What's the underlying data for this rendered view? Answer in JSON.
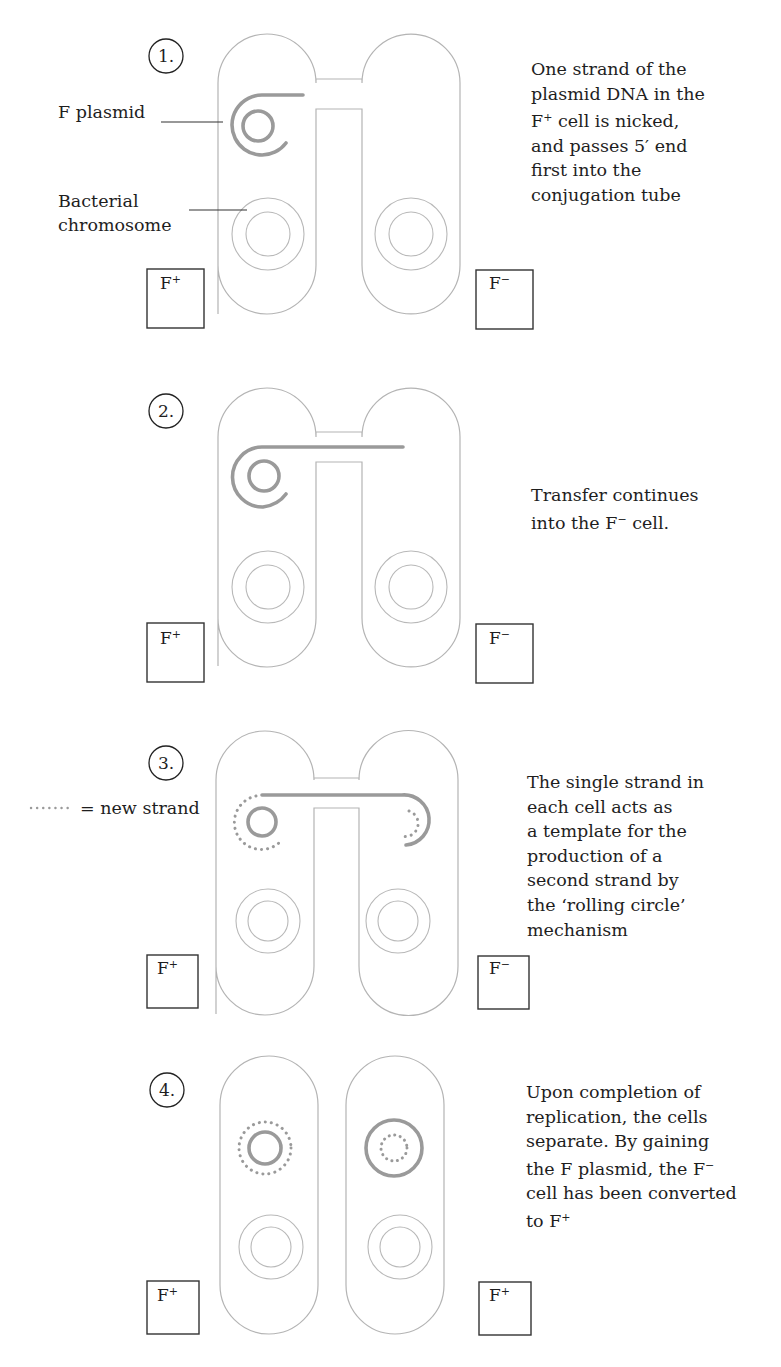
{
  "figure": {
    "colors": {
      "cell_outline": "#b4b4b4",
      "plasmid_strand": "#9a9a9a",
      "text": "#1e1e1e",
      "box_border": "#333333"
    }
  },
  "labels": {
    "f_plasmid": "F plasmid",
    "bacterial_chromosome_line1": "Bacterial",
    "bacterial_chromosome_line2": "chromosome",
    "legend_dots": "·······",
    "legend_text": "= new strand"
  },
  "steps": [
    {
      "number": "1.",
      "left_cell": {
        "base": "F",
        "sup": "+"
      },
      "right_cell": {
        "base": "F",
        "sup": "−"
      },
      "description": [
        "One strand of the",
        "plasmid DNA in the",
        {
          "base": "F",
          "sup": "+",
          "rest": " cell is nicked,"
        },
        "and passes 5′ end",
        "first into the",
        "conjugation tube"
      ]
    },
    {
      "number": "2.",
      "left_cell": {
        "base": "F",
        "sup": "+"
      },
      "right_cell": {
        "base": "F",
        "sup": "−"
      },
      "description": [
        "Transfer continues",
        {
          "pre": "into the ",
          "base": "F",
          "sup": "−",
          "rest": " cell."
        }
      ]
    },
    {
      "number": "3.",
      "left_cell": {
        "base": "F",
        "sup": "+"
      },
      "right_cell": {
        "base": "F",
        "sup": "−"
      },
      "description": [
        "The single strand in",
        "each cell acts as",
        "a template for the",
        "production of a",
        "second strand by",
        "the ‘rolling circle’",
        "mechanism"
      ]
    },
    {
      "number": "4.",
      "left_cell": {
        "base": "F",
        "sup": "+"
      },
      "right_cell": {
        "base": "F",
        "sup": "+"
      },
      "description": [
        "Upon completion of",
        "replication, the cells",
        "separate. By gaining",
        {
          "pre": "the F plasmid, the ",
          "base": "F",
          "sup": "−",
          "rest": ""
        },
        "cell has been converted",
        {
          "pre": "to ",
          "base": "F",
          "sup": "+",
          "rest": ""
        }
      ]
    }
  ]
}
